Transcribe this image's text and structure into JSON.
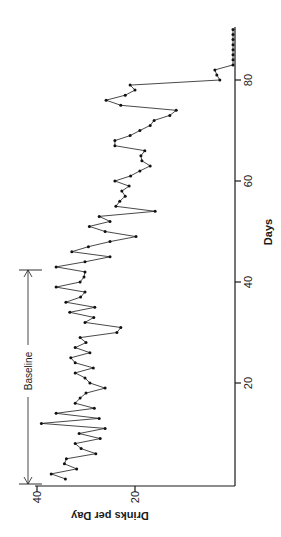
{
  "chart_data": {
    "type": "line",
    "orientation": "rotated-90-ccw",
    "title": "",
    "xlabel": "Days",
    "ylabel": "Drinks per Day",
    "x_ticks": [
      20,
      40,
      60,
      80
    ],
    "y_ticks": [
      20,
      40
    ],
    "xlim": [
      0,
      90
    ],
    "ylim": [
      0,
      40
    ],
    "grid": false,
    "annotations": [
      {
        "text": "Baseline",
        "type": "bracket",
        "x_start": 0,
        "x_end": 42
      }
    ],
    "series": [
      {
        "name": "Drinks per Day",
        "markers": true,
        "x": [
          1,
          2,
          3,
          4,
          5,
          6,
          7,
          8,
          9,
          10,
          11,
          12,
          13,
          14,
          15,
          16,
          17,
          18,
          19,
          20,
          21,
          22,
          23,
          24,
          25,
          26,
          27,
          28,
          29,
          30,
          31,
          32,
          33,
          34,
          35,
          36,
          37,
          38,
          39,
          40,
          41,
          42,
          43,
          44,
          45,
          46,
          47,
          48,
          49,
          50,
          51,
          52,
          53,
          54,
          55,
          56,
          57,
          58,
          59,
          60,
          61,
          62,
          63,
          64,
          65,
          66,
          67,
          68,
          69,
          70,
          71,
          72,
          73,
          74,
          75,
          76,
          77,
          78,
          79,
          80,
          81,
          82,
          83,
          84,
          85,
          86,
          87,
          88,
          89,
          90
        ],
        "values": [
          34.2,
          37.1,
          31.9,
          34.4,
          34.0,
          28.0,
          31.0,
          32.2,
          27.1,
          31.4,
          26.1,
          39.1,
          27.3,
          36.1,
          28.3,
          32.2,
          31.2,
          30.0,
          26.1,
          29.2,
          30.2,
          32.2,
          28.5,
          32.2,
          33.1,
          29.2,
          32.2,
          30.0,
          31.2,
          23.7,
          22.9,
          30.2,
          28.4,
          33.3,
          28.2,
          34.1,
          31.1,
          30.2,
          36.1,
          31.2,
          30.4,
          30.2,
          36.1,
          30.2,
          25.1,
          32.9,
          29.5,
          25.1,
          19.8,
          26.1,
          29.3,
          25.1,
          27.3,
          15.9,
          23.9,
          23.1,
          22.0,
          22.7,
          21.2,
          24.1,
          20.9,
          19.0,
          16.9,
          18.6,
          18.8,
          18.0,
          24.1,
          24.1,
          21.0,
          19.0,
          16.9,
          16.1,
          12.9,
          11.6,
          22.9,
          25.9,
          22.0,
          20.0,
          21.0,
          2.7,
          3.3,
          3.7,
          0,
          0,
          0,
          0,
          0,
          0,
          0,
          0
        ]
      }
    ]
  },
  "labels": {
    "x_axis": "Days",
    "y_axis": "Drinks   per   Day",
    "baseline": "Baseline",
    "x_tick_labels": [
      "20",
      "40",
      "60",
      "80"
    ],
    "y_tick_labels": [
      "20",
      "40"
    ]
  }
}
